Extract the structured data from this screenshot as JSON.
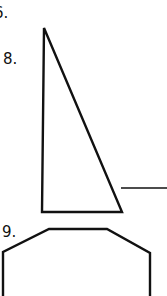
{
  "labels": {
    "item6": "6.",
    "item8": "8.",
    "item9": "9."
  },
  "colors": {
    "stroke": "#111111",
    "background": "#ffffff"
  },
  "figures": {
    "triangle": {
      "points": [
        [
          44,
          28
        ],
        [
          42,
          212
        ],
        [
          122,
          212
        ]
      ]
    },
    "line": {
      "x1": 121,
      "y1": 188,
      "x2": 167,
      "y2": 188
    },
    "octagon_partial": {
      "points": [
        [
          3,
          296
        ],
        [
          3,
          252
        ],
        [
          49,
          229
        ],
        [
          107,
          229
        ],
        [
          150,
          253
        ],
        [
          150,
          296
        ]
      ]
    }
  }
}
